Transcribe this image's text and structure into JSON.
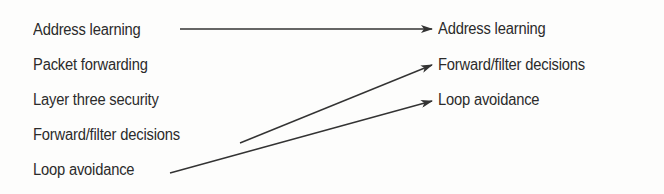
{
  "diagram": {
    "type": "matching",
    "left_column": {
      "items": [
        {
          "label": "Address learning"
        },
        {
          "label": "Packet forwarding"
        },
        {
          "label": "Layer three security"
        },
        {
          "label": "Forward/filter decisions"
        },
        {
          "label": "Loop avoidance"
        }
      ]
    },
    "right_column": {
      "items": [
        {
          "label": "Address learning"
        },
        {
          "label": "Forward/filter decisions"
        },
        {
          "label": "Loop avoidance"
        }
      ]
    },
    "connections": [
      {
        "from": "Address learning",
        "to": "Address learning"
      },
      {
        "from": "Forward/filter decisions",
        "to": "Forward/filter decisions"
      },
      {
        "from": "Loop avoidance",
        "to": "Loop avoidance"
      }
    ],
    "colors": {
      "text": "#2b2b2b",
      "line": "#333333",
      "background": "#fdfdfc"
    }
  }
}
